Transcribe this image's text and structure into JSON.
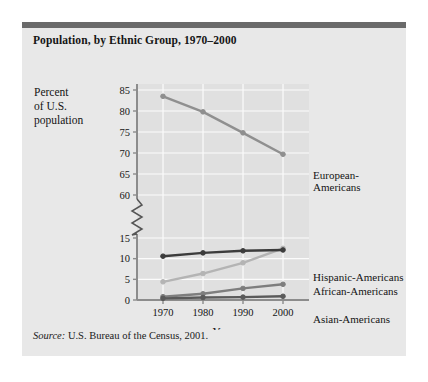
{
  "figure": {
    "title": "Population, by Ethnic Group, 1970–2000",
    "source_label": "Source:",
    "source_text": "U.S. Bureau of the Census, 2001.",
    "background_color": "#e8e8e8",
    "rule_color": "#6a6a6a"
  },
  "chart_data": {
    "type": "line",
    "title": "Population, by Ethnic Group, 1970–2000",
    "xlabel": "Year",
    "ylabel": "Percent of U.S. population",
    "ylabel_lines": [
      "Percent",
      "of U.S.",
      "population"
    ],
    "x": [
      1970,
      1980,
      1990,
      2000
    ],
    "categories": [
      "1970",
      "1980",
      "1990",
      "2000"
    ],
    "xtick_labels": [
      "1970",
      "1980",
      "1990",
      "2000"
    ],
    "ytick_labels": [
      "0",
      "5",
      "10",
      "15",
      "60",
      "65",
      "70",
      "75",
      "80",
      "85"
    ],
    "ylim_lower": [
      0,
      15
    ],
    "ylim_upper": [
      60,
      85
    ],
    "axis_break": true,
    "axis_break_between": [
      15,
      60
    ],
    "grid": true,
    "legend_position": "right-inline",
    "series": [
      {
        "name": "European-Americans",
        "label": "European-\nAmericans",
        "label_lines": [
          "European-",
          "Americans"
        ],
        "color": "#8f8f8f",
        "values": [
          83.5,
          79.8,
          74.8,
          69.7
        ]
      },
      {
        "name": "Hispanic-Americans",
        "label": "Hispanic-Americans",
        "label_lines": [
          "Hispanic-Americans"
        ],
        "color": "#b4b4b4",
        "values": [
          4.4,
          6.4,
          9.0,
          12.5
        ]
      },
      {
        "name": "African-Americans",
        "label": "African-Americans",
        "label_lines": [
          "African-Americans"
        ],
        "color": "#3c3c3c",
        "values": [
          10.6,
          11.4,
          11.9,
          12.1
        ]
      },
      {
        "name": "Asian-Americans",
        "label": "Asian-Americans",
        "label_lines": [
          "Asian-Americans"
        ],
        "color": "#7e7e7e",
        "values": [
          0.8,
          1.5,
          2.8,
          3.8
        ]
      },
      {
        "name": "Native Americans",
        "label": "Native Americans",
        "label_lines": [
          "Native Americans"
        ],
        "color": "#5a5a5a",
        "values": [
          0.4,
          0.6,
          0.7,
          0.9
        ]
      }
    ]
  }
}
